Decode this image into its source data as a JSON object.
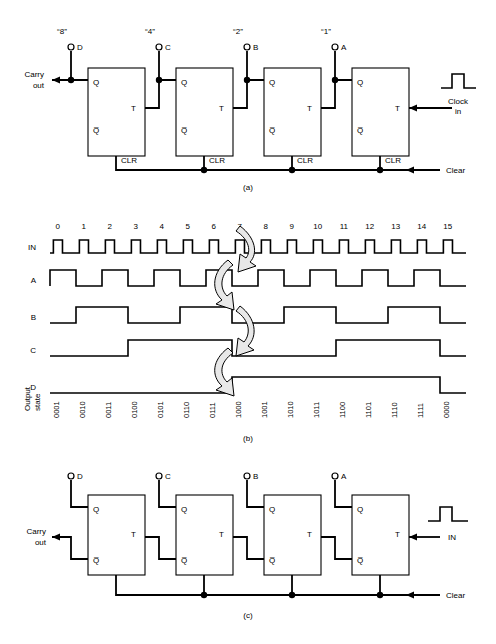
{
  "figure": {
    "panels": [
      {
        "id": "a",
        "caption": "(a)"
      },
      {
        "id": "b",
        "caption": "(b)"
      },
      {
        "id": "c",
        "caption": "(c)"
      }
    ]
  },
  "panel_a": {
    "caption": "(a)",
    "carry_out": "Carry\nout",
    "carry_out_line1": "Carry",
    "carry_out_line2": "out",
    "clock_line1": "Clock",
    "clock_line2": "in",
    "clear_label": "Clear",
    "stages": [
      {
        "weight": "“8”",
        "terminal": "D",
        "q": "Q",
        "qbar": "Q̅",
        "t": "T",
        "clr": "CLR"
      },
      {
        "weight": "“4”",
        "terminal": "C",
        "q": "Q",
        "qbar": "Q̅",
        "t": "T",
        "clr": "CLR"
      },
      {
        "weight": "“2”",
        "terminal": "B",
        "q": "Q",
        "qbar": "Q̅",
        "t": "T",
        "clr": "CLR"
      },
      {
        "weight": "“1”",
        "terminal": "A",
        "q": "Q",
        "qbar": "Q̅",
        "t": "T",
        "clr": "CLR"
      }
    ]
  },
  "panel_b": {
    "caption": "(b)",
    "row_labels": [
      "IN",
      "A",
      "B",
      "C",
      "D"
    ],
    "output_state_label_line1": "Output",
    "output_state_label_line2": "state",
    "ticks": [
      "0",
      "1",
      "2",
      "3",
      "4",
      "5",
      "6",
      "7",
      "8",
      "9",
      "10",
      "11",
      "12",
      "13",
      "14",
      "15"
    ],
    "output_states": [
      "0001",
      "0010",
      "0011",
      "0100",
      "0101",
      "0110",
      "0111",
      "1000",
      "1001",
      "1010",
      "1011",
      "1100",
      "1101",
      "1110",
      "1111",
      "0000"
    ],
    "arrow_count": 4
  },
  "panel_c": {
    "caption": "(c)",
    "carry_out_line1": "Carry",
    "carry_out_line2": "out",
    "in_label": "IN",
    "clear_label": "Clear",
    "stages": [
      {
        "terminal": "D",
        "q": "Q",
        "qbar": "Q̅",
        "t": "T"
      },
      {
        "terminal": "C",
        "q": "Q",
        "qbar": "Q̅",
        "t": "T"
      },
      {
        "terminal": "B",
        "q": "Q",
        "qbar": "Q̅",
        "t": "T"
      },
      {
        "terminal": "A",
        "q": "Q",
        "qbar": "Q̅",
        "t": "T"
      }
    ]
  },
  "chart_data": {
    "type": "line",
    "xlabel": "Clock pulse number",
    "x": [
      0,
      1,
      2,
      3,
      4,
      5,
      6,
      7,
      8,
      9,
      10,
      11,
      12,
      13,
      14,
      15
    ],
    "series": [
      {
        "name": "IN",
        "description": "clock pulses, one narrow high pulse per count",
        "values": [
          1,
          1,
          1,
          1,
          1,
          1,
          1,
          1,
          1,
          1,
          1,
          1,
          1,
          1,
          1,
          1
        ]
      },
      {
        "name": "A",
        "description": "LSB, toggles every clock, period 2",
        "values": [
          1,
          0,
          1,
          0,
          1,
          0,
          1,
          0,
          1,
          0,
          1,
          0,
          1,
          0,
          1,
          0
        ]
      },
      {
        "name": "B",
        "description": "period 4",
        "values": [
          0,
          1,
          1,
          0,
          0,
          1,
          1,
          0,
          0,
          1,
          1,
          0,
          0,
          1,
          1,
          0
        ]
      },
      {
        "name": "C",
        "description": "period 8",
        "values": [
          0,
          0,
          0,
          1,
          1,
          1,
          1,
          0,
          0,
          0,
          0,
          1,
          1,
          1,
          1,
          0
        ]
      },
      {
        "name": "D",
        "description": "MSB, period 16",
        "values": [
          0,
          0,
          0,
          0,
          0,
          0,
          0,
          1,
          1,
          1,
          1,
          1,
          1,
          1,
          1,
          0
        ]
      }
    ],
    "legend": "none",
    "grid": false
  },
  "colors": {
    "ink": "#000000",
    "paper": "#ffffff",
    "arrow_fill": "#e8e8e8"
  }
}
